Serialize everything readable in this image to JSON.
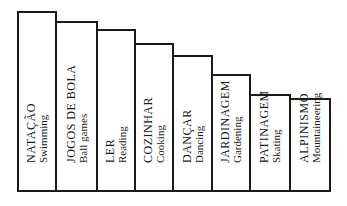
{
  "chart_data": {
    "type": "bar",
    "title": "",
    "xlabel": "",
    "ylabel": "",
    "grid": false,
    "legend": "none",
    "categories": [
      {
        "pt": "NATAÇÃO",
        "en": "Swimming"
      },
      {
        "pt": "JOGOS DE BOLA",
        "en": "Ball games"
      },
      {
        "pt": "LER",
        "en": "Reading"
      },
      {
        "pt": "COZINHAR",
        "en": "Cooking"
      },
      {
        "pt": "DANÇAR",
        "en": "Dancing"
      },
      {
        "pt": "JARDINAGEM",
        "en": "Gardening"
      },
      {
        "pt": "PATINAGEM",
        "en": "Skating"
      },
      {
        "pt": "ALPINISMO",
        "en": "Mountaineering"
      }
    ],
    "values": [
      180,
      170,
      162,
      148,
      136,
      117,
      97,
      93
    ],
    "value_note": "relative bar heights in pixels (no axis shown)",
    "bar_edges_px": [
      18,
      56,
      97,
      135,
      173,
      212,
      250,
      290,
      330
    ],
    "baseline_px": 191
  }
}
